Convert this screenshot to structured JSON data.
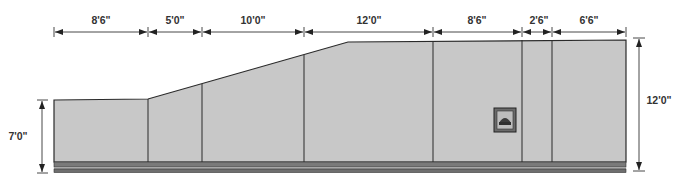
{
  "diagram": {
    "type": "wall-elevation",
    "colors": {
      "wall_fill": "#c8c8c8",
      "outline": "#2a2a2a",
      "base_band_dark": "#6e6e6e",
      "base_band_mid": "#9a9a9a",
      "dimension_line": "#333333",
      "outlet_frame": "#555555"
    },
    "top_dimensions": [
      {
        "label": "8'6\"",
        "x1": 54,
        "x2": 148
      },
      {
        "label": "5'0\"",
        "x1": 148,
        "x2": 202
      },
      {
        "label": "10'0\"",
        "x1": 202,
        "x2": 304
      },
      {
        "label": "12'0\"",
        "x1": 304,
        "x2": 433
      },
      {
        "label": "8'6\"",
        "x1": 433,
        "x2": 522
      },
      {
        "label": "2'6\"",
        "x1": 522,
        "x2": 552
      },
      {
        "label": "6'6\"",
        "x1": 552,
        "x2": 626
      }
    ],
    "left_height": {
      "label": "7'0\""
    },
    "right_height": {
      "label": "12'0\""
    },
    "panels": [
      {
        "name": "panel-1",
        "width": "8'6\""
      },
      {
        "name": "panel-2",
        "width": "5'0\""
      },
      {
        "name": "panel-3",
        "width": "10'0\""
      },
      {
        "name": "panel-4",
        "width": "12'0\""
      },
      {
        "name": "panel-5",
        "width": "8'6\""
      },
      {
        "name": "panel-6",
        "width": "2'6\""
      },
      {
        "name": "panel-7",
        "width": "6'6\""
      }
    ],
    "fixture": {
      "name": "wall-outlet-box"
    }
  }
}
